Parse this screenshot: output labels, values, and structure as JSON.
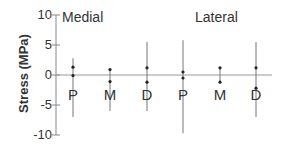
{
  "chart_data": {
    "type": "scatter",
    "title": "",
    "xlabel": "",
    "ylabel": "Stress (MPa)",
    "ylim": [
      -10,
      10
    ],
    "yticks": [
      10,
      5,
      0,
      -5,
      -10
    ],
    "grid": false,
    "groups": [
      "Medial",
      "Lateral"
    ],
    "categories": [
      "P",
      "M",
      "D",
      "P",
      "M",
      "D"
    ],
    "series": [
      {
        "group": "Medial",
        "category": "P",
        "upper_point": 1.3,
        "lower_point": -0.1,
        "range_max": 2.8,
        "range_min": -7.0
      },
      {
        "group": "Medial",
        "category": "M",
        "upper_point": 0.9,
        "lower_point": -1.1,
        "range_max": 1.0,
        "range_min": -6.0
      },
      {
        "group": "Medial",
        "category": "D",
        "upper_point": 1.2,
        "lower_point": -1.2,
        "range_max": 5.5,
        "range_min": -6.0
      },
      {
        "group": "Lateral",
        "category": "P",
        "upper_point": 0.5,
        "lower_point": -0.5,
        "range_max": 5.8,
        "range_min": -9.7
      },
      {
        "group": "Lateral",
        "category": "M",
        "upper_point": 1.2,
        "lower_point": -1.2,
        "range_max": 1.2,
        "range_min": -1.2
      },
      {
        "group": "Lateral",
        "category": "D",
        "upper_point": 1.2,
        "lower_point": -2.2,
        "range_max": 5.5,
        "range_min": -7.0
      }
    ]
  },
  "labels": {
    "ylabel": "Stress (MPa)",
    "ticks": [
      "10",
      "5",
      "0",
      "-5",
      "-10"
    ],
    "groups": [
      "Medial",
      "Lateral"
    ],
    "categories": [
      "P",
      "M",
      "D",
      "P",
      "M",
      "D"
    ]
  }
}
